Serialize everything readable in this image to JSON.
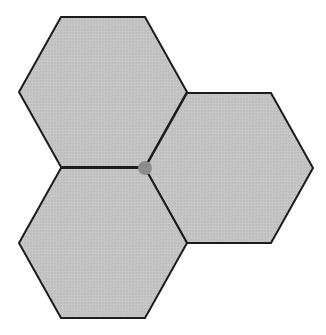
{
  "diagram": {
    "colors": {
      "background": "#ffffff",
      "hex_fill": "#c4c4c4",
      "hex_stroke": "#1c1c1c",
      "vertex_dot": "#8c8c8c"
    },
    "stroke_width": 2,
    "hexagons": [
      {
        "id": "top-left",
        "points": "19,92 61,17 145,17 187,92 145,167 61,167"
      },
      {
        "id": "right",
        "points": "145,168 187,93 271,93 313,168 271,243 187,243"
      },
      {
        "id": "bottom-left",
        "points": "19,243 61,168 145,168 187,243 145,318 61,318"
      }
    ],
    "shared_vertex": {
      "cx": 145,
      "cy": 168,
      "r": 7
    }
  }
}
